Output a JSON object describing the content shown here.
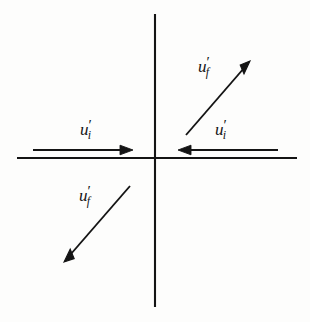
{
  "figure": {
    "background_color": "#fdfdfc",
    "stroke_color": "#141414",
    "width": 310,
    "height": 322
  },
  "axes": {
    "name": "cartesian-axes",
    "origin": {
      "x": 155,
      "y": 158
    },
    "vertical": {
      "x": 155,
      "y1": 14,
      "y2": 307
    },
    "horizontal": {
      "y": 158,
      "x1": 17,
      "x2": 297
    },
    "line_width": 2
  },
  "vectors": [
    {
      "id": "uf-quadrant-1",
      "name": "vector-uf-upper-right",
      "label": {
        "base": "u",
        "prime": "′",
        "sub": "f"
      },
      "label_text": "u'f",
      "direction": "up-right",
      "tail": {
        "x": 186,
        "y": 135
      },
      "tip": {
        "x": 250,
        "y": 61
      },
      "quadrant": "I"
    },
    {
      "id": "ui-quadrant-2",
      "name": "vector-ui-left-pointing-right",
      "label": {
        "base": "u",
        "prime": "′",
        "sub": "i"
      },
      "label_text": "u'i",
      "direction": "right",
      "tail": {
        "x": 33,
        "y": 150
      },
      "tip": {
        "x": 133,
        "y": 150
      },
      "quadrant": "II"
    },
    {
      "id": "ui-quadrant-1",
      "name": "vector-ui-right-pointing-left",
      "label": {
        "base": "u",
        "prime": "′",
        "sub": "i"
      },
      "label_text": "u'i",
      "direction": "left",
      "tail": {
        "x": 278,
        "y": 150
      },
      "tip": {
        "x": 178,
        "y": 150
      },
      "quadrant": "I"
    },
    {
      "id": "uf-quadrant-3",
      "name": "vector-uf-lower-left",
      "label": {
        "base": "u",
        "prime": "′",
        "sub": "f"
      },
      "label_text": "u'f",
      "direction": "down-left",
      "tail": {
        "x": 130,
        "y": 186
      },
      "tip": {
        "x": 64,
        "y": 262
      },
      "quadrant": "III"
    }
  ]
}
